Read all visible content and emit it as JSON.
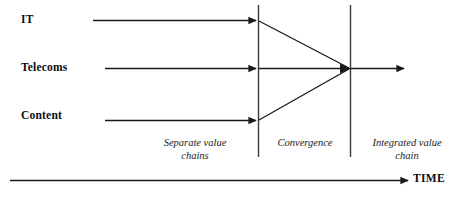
{
  "diagram": {
    "stroke_color": "#1a1a1a",
    "background_color": "#ffffff",
    "streams": [
      {
        "id": "it",
        "label": "IT"
      },
      {
        "id": "telecoms",
        "label": "Telecoms"
      },
      {
        "id": "content",
        "label": "Content"
      }
    ],
    "phases": [
      {
        "id": "separate",
        "label": "Separate value\nchains"
      },
      {
        "id": "convergence",
        "label": "Convergence"
      },
      {
        "id": "integrated",
        "label": "Integrated value\nchain"
      }
    ],
    "axis": {
      "label": "TIME"
    }
  }
}
